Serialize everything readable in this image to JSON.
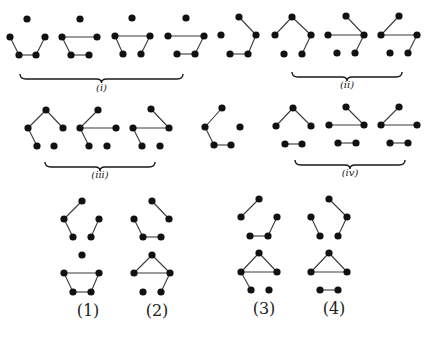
{
  "figure": {
    "width": 436,
    "height": 337,
    "colors": {
      "node": "#111111",
      "edge": "#3a3a3a",
      "text": "#222222"
    },
    "node_radius": 3.6,
    "graphs": [
      {
        "id": "r1-g1",
        "group": "i",
        "nodes": [
          [
            27,
            19
          ],
          [
            10,
            37
          ],
          [
            45,
            37
          ],
          [
            19,
            55
          ],
          [
            36,
            55
          ]
        ],
        "edges": [
          [
            1,
            3
          ],
          [
            3,
            4
          ],
          [
            4,
            2
          ]
        ]
      },
      {
        "id": "r1-g2",
        "group": "i",
        "nodes": [
          [
            80,
            19
          ],
          [
            62,
            37
          ],
          [
            97,
            37
          ],
          [
            71,
            55
          ],
          [
            89,
            55
          ]
        ],
        "edges": [
          [
            1,
            2
          ],
          [
            1,
            3
          ],
          [
            3,
            4
          ]
        ]
      },
      {
        "id": "r1-g3",
        "group": "i",
        "nodes": [
          [
            132,
            18
          ],
          [
            115,
            36
          ],
          [
            150,
            36
          ],
          [
            123,
            54
          ],
          [
            141,
            54
          ]
        ],
        "edges": [
          [
            1,
            2
          ],
          [
            1,
            3
          ],
          [
            2,
            4
          ]
        ]
      },
      {
        "id": "r1-g4",
        "group": "i",
        "nodes": [
          [
            186,
            18
          ],
          [
            168,
            36
          ],
          [
            204,
            36
          ],
          [
            177,
            54
          ],
          [
            195,
            54
          ]
        ],
        "edges": [
          [
            1,
            2
          ],
          [
            2,
            4
          ],
          [
            3,
            4
          ]
        ]
      },
      {
        "id": "r1-g5",
        "group": "",
        "nodes": [
          [
            239,
            17
          ],
          [
            221,
            35
          ],
          [
            256,
            35
          ],
          [
            230,
            54
          ],
          [
            248,
            54
          ]
        ],
        "edges": [
          [
            0,
            2
          ],
          [
            2,
            4
          ],
          [
            3,
            4
          ]
        ]
      },
      {
        "id": "r1-g6",
        "group": "ii",
        "nodes": [
          [
            292,
            17
          ],
          [
            275,
            35
          ],
          [
            311,
            35
          ],
          [
            284,
            54
          ],
          [
            302,
            54
          ]
        ],
        "edges": [
          [
            0,
            1
          ],
          [
            0,
            2
          ],
          [
            2,
            4
          ]
        ]
      },
      {
        "id": "r1-g7",
        "group": "ii",
        "nodes": [
          [
            346,
            16
          ],
          [
            328,
            35
          ],
          [
            364,
            35
          ],
          [
            337,
            53
          ],
          [
            355,
            53
          ]
        ],
        "edges": [
          [
            0,
            2
          ],
          [
            1,
            2
          ],
          [
            2,
            4
          ]
        ]
      },
      {
        "id": "r1-g8",
        "group": "ii",
        "nodes": [
          [
            399,
            16
          ],
          [
            381,
            35
          ],
          [
            417,
            35
          ],
          [
            390,
            53
          ],
          [
            408,
            53
          ]
        ],
        "edges": [
          [
            0,
            1
          ],
          [
            1,
            2
          ],
          [
            2,
            4
          ]
        ]
      },
      {
        "id": "r2-g1",
        "group": "iii",
        "nodes": [
          [
            46,
            110
          ],
          [
            28,
            128
          ],
          [
            63,
            128
          ],
          [
            37,
            146
          ],
          [
            54,
            146
          ]
        ],
        "edges": [
          [
            0,
            1
          ],
          [
            0,
            2
          ],
          [
            1,
            3
          ]
        ]
      },
      {
        "id": "r2-g2",
        "group": "iii",
        "nodes": [
          [
            98,
            110
          ],
          [
            80,
            128
          ],
          [
            116,
            128
          ],
          [
            89,
            146
          ],
          [
            107,
            146
          ]
        ],
        "edges": [
          [
            0,
            1
          ],
          [
            1,
            2
          ],
          [
            1,
            3
          ]
        ]
      },
      {
        "id": "r2-g3",
        "group": "iii",
        "nodes": [
          [
            151,
            109
          ],
          [
            133,
            128
          ],
          [
            169,
            128
          ],
          [
            142,
            146
          ],
          [
            160,
            146
          ]
        ],
        "edges": [
          [
            0,
            2
          ],
          [
            1,
            2
          ],
          [
            1,
            3
          ]
        ]
      },
      {
        "id": "r2-g4",
        "group": "",
        "nodes": [
          [
            222,
            108
          ],
          [
            205,
            127
          ],
          [
            240,
            127
          ],
          [
            214,
            145
          ],
          [
            231,
            145
          ]
        ],
        "edges": [
          [
            0,
            1
          ],
          [
            1,
            3
          ],
          [
            3,
            4
          ]
        ]
      },
      {
        "id": "r2-g5",
        "group": "iv",
        "nodes": [
          [
            293,
            108
          ],
          [
            276,
            126
          ],
          [
            311,
            126
          ],
          [
            285,
            144
          ],
          [
            302,
            144
          ]
        ],
        "edges": [
          [
            0,
            1
          ],
          [
            0,
            2
          ],
          [
            3,
            4
          ]
        ]
      },
      {
        "id": "r2-g6",
        "group": "iv",
        "nodes": [
          [
            346,
            107
          ],
          [
            329,
            125
          ],
          [
            364,
            125
          ],
          [
            338,
            143
          ],
          [
            356,
            143
          ]
        ],
        "edges": [
          [
            0,
            2
          ],
          [
            1,
            2
          ],
          [
            3,
            4
          ]
        ]
      },
      {
        "id": "r2-g7",
        "group": "iv",
        "nodes": [
          [
            399,
            107
          ],
          [
            381,
            125
          ],
          [
            417,
            125
          ],
          [
            390,
            143
          ],
          [
            408,
            143
          ]
        ],
        "edges": [
          [
            0,
            1
          ],
          [
            1,
            2
          ],
          [
            3,
            4
          ]
        ]
      },
      {
        "id": "c1-top",
        "group": "1",
        "nodes": [
          [
            82,
            201
          ],
          [
            64,
            219
          ],
          [
            99,
            219
          ],
          [
            73,
            237
          ],
          [
            91,
            237
          ]
        ],
        "edges": [
          [
            0,
            1
          ],
          [
            1,
            3
          ],
          [
            2,
            4
          ]
        ]
      },
      {
        "id": "c1-bot",
        "group": "1",
        "nodes": [
          [
            82,
            255
          ],
          [
            64,
            273
          ],
          [
            99,
            273
          ],
          [
            73,
            292
          ],
          [
            91,
            292
          ]
        ],
        "edges": [
          [
            1,
            2
          ],
          [
            1,
            3
          ],
          [
            3,
            4
          ],
          [
            2,
            4
          ]
        ]
      },
      {
        "id": "c2-top",
        "group": "2",
        "nodes": [
          [
            152,
            201
          ],
          [
            134,
            219
          ],
          [
            169,
            219
          ],
          [
            143,
            237
          ],
          [
            161,
            237
          ]
        ],
        "edges": [
          [
            0,
            2
          ],
          [
            1,
            3
          ],
          [
            3,
            4
          ]
        ]
      },
      {
        "id": "c2-bot",
        "group": "2",
        "nodes": [
          [
            152,
            255
          ],
          [
            134,
            273
          ],
          [
            170,
            273
          ],
          [
            143,
            292
          ],
          [
            161,
            292
          ]
        ],
        "edges": [
          [
            0,
            1
          ],
          [
            0,
            2
          ],
          [
            1,
            2
          ],
          [
            2,
            4
          ]
        ]
      },
      {
        "id": "c3-top",
        "group": "3",
        "nodes": [
          [
            259,
            199
          ],
          [
            241,
            217
          ],
          [
            277,
            217
          ],
          [
            250,
            236
          ],
          [
            268,
            236
          ]
        ],
        "edges": [
          [
            0,
            1
          ],
          [
            2,
            4
          ],
          [
            3,
            4
          ]
        ]
      },
      {
        "id": "c3-bot",
        "group": "3",
        "nodes": [
          [
            259,
            253
          ],
          [
            241,
            272
          ],
          [
            277,
            272
          ],
          [
            251,
            290
          ],
          [
            269,
            290
          ]
        ],
        "edges": [
          [
            0,
            1
          ],
          [
            0,
            2
          ],
          [
            1,
            2
          ],
          [
            1,
            3
          ]
        ]
      },
      {
        "id": "c4-top",
        "group": "4",
        "nodes": [
          [
            329,
            199
          ],
          [
            311,
            217
          ],
          [
            347,
            217
          ],
          [
            320,
            236
          ],
          [
            338,
            236
          ]
        ],
        "edges": [
          [
            0,
            2
          ],
          [
            1,
            3
          ],
          [
            2,
            4
          ]
        ]
      },
      {
        "id": "c4-bot",
        "group": "4",
        "nodes": [
          [
            329,
            253
          ],
          [
            311,
            272
          ],
          [
            347,
            272
          ],
          [
            320,
            290
          ],
          [
            338,
            290
          ]
        ],
        "edges": [
          [
            0,
            1
          ],
          [
            0,
            2
          ],
          [
            1,
            2
          ],
          [
            3,
            4
          ]
        ]
      }
    ],
    "braces": [
      {
        "id": "i",
        "x1": 20,
        "x2": 183,
        "y": 74,
        "label": "(i)",
        "label_y": 91
      },
      {
        "id": "ii",
        "x1": 292,
        "x2": 402,
        "y": 72,
        "label": "(ii)",
        "label_y": 88
      },
      {
        "id": "iii",
        "x1": 45,
        "x2": 155,
        "y": 162,
        "label": "(iii)",
        "label_y": 178
      },
      {
        "id": "iv",
        "x1": 295,
        "x2": 405,
        "y": 160,
        "label": "(iv)",
        "label_y": 176
      }
    ],
    "case_labels": [
      {
        "text": "(1)",
        "x": 88,
        "y": 316
      },
      {
        "text": "(2)",
        "x": 157,
        "y": 316
      },
      {
        "text": "(3)",
        "x": 264,
        "y": 314
      },
      {
        "text": "(4)",
        "x": 334,
        "y": 314
      }
    ]
  }
}
